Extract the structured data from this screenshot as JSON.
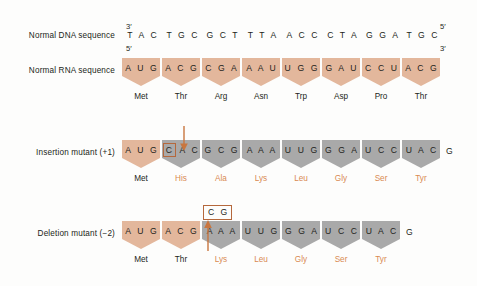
{
  "figure": {
    "background_color": "#fdfdfc",
    "tan_color": "#e3b79c",
    "grey_color": "#a9a9a9",
    "accent_color": "#b5683c",
    "changed_text_color": "#d98a52"
  },
  "rows": {
    "dna": {
      "label": "Normal DNA sequence",
      "left_end": "3′",
      "right_end": "5′",
      "triplets": [
        "T A C",
        "T G C",
        "G C T",
        "T T A",
        "A C C",
        "C T A",
        "G G A",
        "T G C"
      ]
    },
    "rna": {
      "label": "Normal RNA sequence",
      "left_end": "5′",
      "right_end": "3′",
      "codons": [
        {
          "bases": "A U G",
          "color": "tan"
        },
        {
          "bases": "A C G",
          "color": "tan"
        },
        {
          "bases": "C G A",
          "color": "tan"
        },
        {
          "bases": "A A U",
          "color": "tan"
        },
        {
          "bases": "U G G",
          "color": "tan"
        },
        {
          "bases": "G A U",
          "color": "tan"
        },
        {
          "bases": "C C U",
          "color": "tan"
        },
        {
          "bases": "A C G",
          "color": "tan"
        }
      ],
      "amino_acids": [
        {
          "name": "Met",
          "state": "normal"
        },
        {
          "name": "Thr",
          "state": "normal"
        },
        {
          "name": "Arg",
          "state": "normal"
        },
        {
          "name": "Asn",
          "state": "normal"
        },
        {
          "name": "Trp",
          "state": "normal"
        },
        {
          "name": "Asp",
          "state": "normal"
        },
        {
          "name": "Pro",
          "state": "normal"
        },
        {
          "name": "Thr",
          "state": "normal"
        }
      ]
    },
    "insertion": {
      "label": "Insertion mutant (+1)",
      "callout": "",
      "inserted_base": "C",
      "tail_base": "G",
      "codons": [
        {
          "bases": "A U G",
          "color": "tan",
          "boxed_first": false
        },
        {
          "bases": "C A C",
          "color": "grey",
          "boxed_first": true
        },
        {
          "bases": "G C G",
          "color": "grey",
          "boxed_first": false
        },
        {
          "bases": "A A A",
          "color": "grey",
          "boxed_first": false
        },
        {
          "bases": "U U G",
          "color": "grey",
          "boxed_first": false
        },
        {
          "bases": "G G A",
          "color": "grey",
          "boxed_first": false
        },
        {
          "bases": "U C C",
          "color": "grey",
          "boxed_first": false
        },
        {
          "bases": "U A C",
          "color": "grey",
          "boxed_first": false
        }
      ],
      "amino_acids": [
        {
          "name": "Met",
          "state": "normal"
        },
        {
          "name": "His",
          "state": "changed"
        },
        {
          "name": "Ala",
          "state": "changed"
        },
        {
          "name": "Lys",
          "state": "changed"
        },
        {
          "name": "Leu",
          "state": "changed"
        },
        {
          "name": "Gly",
          "state": "changed"
        },
        {
          "name": "Ser",
          "state": "changed"
        },
        {
          "name": "Tyr",
          "state": "changed"
        }
      ]
    },
    "deletion": {
      "label": "Deletion mutant (−2)",
      "callout": "C G",
      "tail_base": "G",
      "codons": [
        {
          "bases": "A U G",
          "color": "tan"
        },
        {
          "bases": "A C G",
          "color": "tan"
        },
        {
          "bases": "A A A",
          "color": "grey"
        },
        {
          "bases": "U U G",
          "color": "grey"
        },
        {
          "bases": "G G A",
          "color": "grey"
        },
        {
          "bases": "U C C",
          "color": "grey"
        },
        {
          "bases": "U A C",
          "color": "grey"
        }
      ],
      "amino_acids": [
        {
          "name": "Met",
          "state": "normal"
        },
        {
          "name": "Thr",
          "state": "normal"
        },
        {
          "name": "Lys",
          "state": "changed"
        },
        {
          "name": "Leu",
          "state": "changed"
        },
        {
          "name": "Gly",
          "state": "changed"
        },
        {
          "name": "Ser",
          "state": "changed"
        },
        {
          "name": "Tyr",
          "state": "changed"
        }
      ]
    }
  }
}
